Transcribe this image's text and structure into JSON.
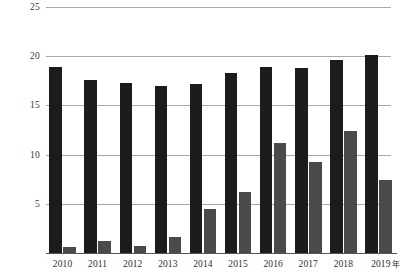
{
  "chart_data": {
    "type": "bar",
    "title": "",
    "xlabel": "年",
    "ylabel": "",
    "categories": [
      "2010",
      "2011",
      "2012",
      "2013",
      "2014",
      "2015",
      "2016",
      "2017",
      "2018",
      "2019"
    ],
    "x_axis_unit_label": "年",
    "ylim": [
      0,
      25
    ],
    "yticks": [
      5,
      10,
      15,
      20,
      25
    ],
    "ytick_labels": [
      "5",
      "10",
      "15",
      "20",
      "25"
    ],
    "grid": true,
    "legend": "none",
    "series": [
      {
        "name": "series-dark",
        "color": "#1c1c1c",
        "values": [
          18.9,
          17.6,
          17.3,
          17.0,
          17.2,
          18.3,
          18.9,
          18.8,
          19.6,
          20.1
        ]
      },
      {
        "name": "series-gray",
        "color": "#4a4a4a",
        "values": [
          0.6,
          1.2,
          0.7,
          1.6,
          4.5,
          6.2,
          11.2,
          9.3,
          12.4,
          7.4
        ]
      }
    ]
  },
  "axis": {
    "baseline_color": "#555555",
    "gridline_color": "#a8a8a8"
  }
}
